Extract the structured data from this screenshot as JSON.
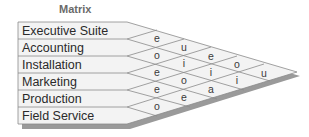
{
  "title": "Matrix",
  "rows": [
    {
      "label": "Executive Suite"
    },
    {
      "label": "Accounting"
    },
    {
      "label": "Installation"
    },
    {
      "label": "Marketing"
    },
    {
      "label": "Production"
    },
    {
      "label": "Field Service"
    }
  ],
  "relationships": [
    {
      "rows": [
        "Executive Suite",
        "Accounting"
      ],
      "value": "e"
    },
    {
      "rows": [
        "Accounting",
        "Installation"
      ],
      "value": "o"
    },
    {
      "rows": [
        "Installation",
        "Marketing"
      ],
      "value": "e"
    },
    {
      "rows": [
        "Marketing",
        "Production"
      ],
      "value": "e"
    },
    {
      "rows": [
        "Production",
        "Field Service"
      ],
      "value": "o"
    },
    {
      "rows": [
        "Executive Suite",
        "Installation"
      ],
      "value": "u"
    },
    {
      "rows": [
        "Accounting",
        "Marketing"
      ],
      "value": "i"
    },
    {
      "rows": [
        "Installation",
        "Production"
      ],
      "value": "o"
    },
    {
      "rows": [
        "Marketing",
        "Field Service"
      ],
      "value": "e"
    },
    {
      "rows": [
        "Executive Suite",
        "Marketing"
      ],
      "value": "e"
    },
    {
      "rows": [
        "Accounting",
        "Production"
      ],
      "value": "i"
    },
    {
      "rows": [
        "Installation",
        "Field Service"
      ],
      "value": "a"
    },
    {
      "rows": [
        "Executive Suite",
        "Production"
      ],
      "value": "o"
    },
    {
      "rows": [
        "Accounting",
        "Field Service"
      ],
      "value": "i"
    },
    {
      "rows": [
        "Executive Suite",
        "Field Service"
      ],
      "value": "u"
    }
  ],
  "colors": {
    "fill": "#f2f2f2",
    "line": "#8a8a8a",
    "shadow": "#9a9a9a",
    "text": "#2a2a2a",
    "title": "#6a6a6a"
  }
}
